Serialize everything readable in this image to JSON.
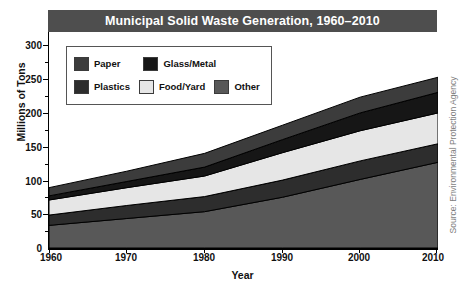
{
  "title": "Municipal Solid Waste Generation, 1960–2010",
  "source_note": "Source: Environmental Protection Agency",
  "axes": {
    "x_title": "Year",
    "y_title": "Millions of Tons",
    "x_ticks": [
      "1960",
      "1970",
      "1980",
      "1990",
      "2000",
      "2010"
    ],
    "y_ticks": [
      "0",
      "50",
      "100",
      "150",
      "200",
      "250",
      "300"
    ]
  },
  "legend": {
    "rows": [
      [
        {
          "label": "Paper",
          "color": "#3c3c3c"
        },
        {
          "label": "Glass/Metal",
          "color": "#161616"
        }
      ],
      [
        {
          "label": "Plastics",
          "color": "#2d2d2d"
        },
        {
          "label": "Food/Yard",
          "color": "#e6e6e6"
        },
        {
          "label": "Other",
          "color": "#585858"
        }
      ]
    ]
  },
  "chart_data": {
    "type": "area",
    "stacked": true,
    "title": "Municipal Solid Waste Generation, 1960–2010",
    "xlabel": "Year",
    "ylabel": "Millions of Tons",
    "xlim": [
      1960,
      2010
    ],
    "ylim": [
      0,
      315
    ],
    "grid": false,
    "legend_position": "inside-top-left",
    "x": [
      1960,
      1970,
      1980,
      1990,
      2000,
      2010
    ],
    "x_tick_labels": [
      "1960",
      "1970",
      "1980",
      "1990",
      "2000",
      "2010"
    ],
    "y_tick_labels": [
      "0",
      "50",
      "100",
      "150",
      "200",
      "250",
      "300"
    ],
    "stack_order_bottom_to_top": [
      "Other",
      "Plastics",
      "Food/Yard",
      "Glass/Metal",
      "Paper"
    ],
    "series": [
      {
        "name": "Other",
        "color": "#585858",
        "values": [
          33,
          43,
          53,
          74,
          100,
          125
        ]
      },
      {
        "name": "Plastics",
        "color": "#2d2d2d",
        "values": [
          15,
          19,
          22,
          25,
          27,
          27
        ]
      },
      {
        "name": "Food/Yard",
        "color": "#e6e6e6",
        "values": [
          22,
          26,
          30,
          40,
          44,
          45
        ]
      },
      {
        "name": "Glass/Metal",
        "color": "#161616",
        "values": [
          6,
          9,
          13,
          19,
          26,
          30
        ]
      },
      {
        "name": "Paper",
        "color": "#3c3c3c",
        "values": [
          12,
          15,
          20,
          21,
          23,
          22
        ]
      }
    ],
    "cumulative_totals": [
      88,
      112,
      138,
      179,
      220,
      249
    ]
  }
}
